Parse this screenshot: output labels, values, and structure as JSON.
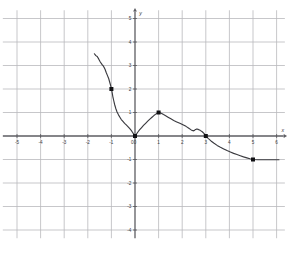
{
  "chart_data": {
    "type": "line",
    "title": "",
    "subtitle": "",
    "xlabel": "x",
    "ylabel": "y",
    "xlim": [
      -5.6,
      6.4
    ],
    "ylim": [
      -4.4,
      5.4
    ],
    "grid": true,
    "grid_step": 1,
    "legend": "none",
    "x_ticks": [
      -5,
      -4,
      -3,
      -2,
      -1,
      0,
      1,
      2,
      3,
      4,
      5,
      6
    ],
    "x_tick_labels": [
      "-5",
      "-4",
      "-3",
      "-2",
      "-1",
      "0",
      "1",
      "2",
      "3",
      "4",
      "5",
      "6"
    ],
    "y_ticks": [
      -4,
      -3,
      -2,
      -1,
      1,
      2,
      3,
      4,
      5
    ],
    "y_tick_labels": [
      "-4",
      "-3",
      "-2",
      "-1",
      "1",
      "2",
      "3",
      "4",
      "5"
    ],
    "series": [
      {
        "name": "curve",
        "color": "#3a3a3f",
        "x": [
          -1.72,
          -1.66,
          -1.6,
          -1.54,
          -1.47,
          -1.4,
          -1.33,
          -1.27,
          -1.22,
          -1.17,
          -1.12,
          -1.08,
          -1.04,
          -1.0,
          -0.97,
          -0.94,
          -0.9,
          -0.86,
          -0.81,
          -0.76,
          -0.7,
          -0.64,
          -0.58,
          -0.51,
          -0.44,
          -0.37,
          -0.3,
          -0.23,
          -0.16,
          -0.1,
          -0.05,
          0.0,
          0.06,
          0.13,
          0.2,
          0.28,
          0.36,
          0.45,
          0.54,
          0.63,
          0.72,
          0.8,
          0.88,
          0.94,
          1.0,
          1.06,
          1.13,
          1.21,
          1.3,
          1.4,
          1.52,
          1.64,
          1.77,
          1.9,
          2.03,
          2.16,
          2.28,
          2.38,
          2.46,
          2.52,
          2.57,
          2.62,
          2.68,
          2.76,
          2.85,
          2.93,
          3.0,
          3.1,
          3.22,
          3.35,
          3.48,
          3.62,
          3.76,
          3.9,
          4.04,
          4.18,
          4.32,
          4.46,
          4.6,
          4.74,
          4.87,
          5.0,
          5.2,
          5.45,
          5.7,
          5.95,
          6.1
        ],
        "y": [
          3.5,
          3.42,
          3.38,
          3.28,
          3.15,
          3.05,
          2.96,
          2.84,
          2.7,
          2.58,
          2.46,
          2.32,
          2.18,
          2.02,
          1.86,
          1.68,
          1.5,
          1.33,
          1.16,
          1.02,
          0.9,
          0.8,
          0.7,
          0.62,
          0.54,
          0.47,
          0.4,
          0.32,
          0.24,
          0.15,
          0.07,
          0.0,
          0.08,
          0.18,
          0.27,
          0.36,
          0.45,
          0.54,
          0.63,
          0.72,
          0.8,
          0.87,
          0.93,
          0.97,
          1.0,
          0.99,
          0.96,
          0.91,
          0.86,
          0.8,
          0.73,
          0.66,
          0.6,
          0.54,
          0.48,
          0.41,
          0.33,
          0.26,
          0.22,
          0.24,
          0.28,
          0.3,
          0.28,
          0.24,
          0.18,
          0.1,
          0.0,
          -0.1,
          -0.21,
          -0.31,
          -0.4,
          -0.48,
          -0.55,
          -0.62,
          -0.68,
          -0.74,
          -0.79,
          -0.84,
          -0.89,
          -0.93,
          -0.97,
          -1.0,
          -1.01,
          -1.01,
          -1.01,
          -1.01,
          -1.01
        ]
      }
    ],
    "marked_points": [
      {
        "label": "",
        "x": -1,
        "y": 2
      },
      {
        "label": "",
        "x": 0,
        "y": 0
      },
      {
        "label": "",
        "x": 1,
        "y": 1
      },
      {
        "label": "",
        "x": 3,
        "y": 0
      },
      {
        "label": "",
        "x": 5,
        "y": -1
      }
    ]
  },
  "axes": {
    "x_axis_name": "x",
    "y_axis_name": "y"
  }
}
